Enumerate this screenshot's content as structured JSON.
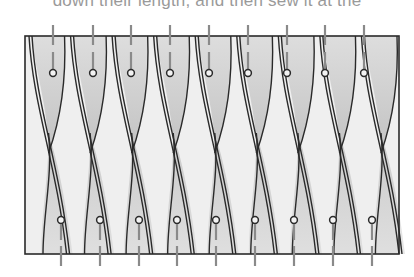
{
  "caption": {
    "text": "down their length, and then sew it at the"
  },
  "diagram": {
    "frame": {
      "x": 25,
      "y": 36,
      "width": 374,
      "height": 218
    },
    "columns": 9,
    "top_pins_x": [
      53,
      93,
      131,
      170,
      209,
      248,
      287,
      325,
      364
    ],
    "bottom_pins_x": [
      61,
      100,
      139,
      177,
      216,
      255,
      294,
      333,
      372
    ],
    "colors": {
      "outline": "#2a2a2a",
      "shade_dark": "#bdbdbd",
      "shade_light": "#f2f2f2",
      "pin": "#8a8a8a"
    }
  }
}
